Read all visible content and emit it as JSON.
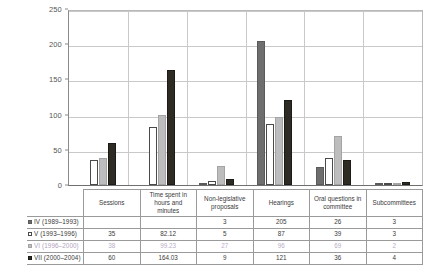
{
  "chart_data": {
    "type": "bar",
    "title": "",
    "xlabel": "",
    "ylabel": "",
    "ylim": [
      0,
      250
    ],
    "yticks": [
      0,
      50,
      100,
      150,
      200,
      250
    ],
    "grid": true,
    "legend_position": "table-left",
    "categories": [
      "Sessions",
      "Time spent in hours and minutes",
      "Non-legislative proposals",
      "Hearings",
      "Oral questions in committee",
      "Subcommittees"
    ],
    "series": [
      {
        "name": "IV (1989–1993)",
        "key": "s0",
        "color": "#6e6e6e",
        "values": [
          null,
          null,
          3,
          205,
          26,
          3
        ],
        "display": [
          "",
          "",
          "3",
          "205",
          "26",
          "3"
        ]
      },
      {
        "name": "V (1993–1996)",
        "key": "s1",
        "color": "#ffffff",
        "values": [
          35,
          82.12,
          5,
          87,
          39,
          3
        ],
        "display": [
          "35",
          "82.12",
          "5",
          "87",
          "39",
          "3"
        ]
      },
      {
        "name": "VI (1996–2000)",
        "key": "s2",
        "color": "#bdbdbd",
        "values": [
          38,
          99.23,
          27,
          96,
          69,
          2
        ],
        "display": [
          "38",
          "99.23",
          "27",
          "96",
          "69",
          "2"
        ],
        "faded": true
      },
      {
        "name": "VII (2000–2004)",
        "key": "s3",
        "color": "#2e2b24",
        "values": [
          60,
          164.03,
          9,
          121,
          36,
          4
        ],
        "display": [
          "60",
          "164.03",
          "9",
          "121",
          "36",
          "4"
        ]
      }
    ]
  },
  "table": {
    "corner_label": "",
    "headers": [
      "Sessions",
      "Time spent in hours and minutes",
      "Non-legislative proposals",
      "Hearings",
      "Oral questions in committee",
      "Subcommittees"
    ],
    "rows": [
      {
        "label": "IV  (1989–1993)",
        "key": "s0",
        "cells": [
          "",
          "",
          "3",
          "205",
          "26",
          "3"
        ]
      },
      {
        "label": "V  (1993–1996)",
        "key": "s1",
        "cells": [
          "35",
          "82.12",
          "5",
          "87",
          "39",
          "3"
        ]
      },
      {
        "label": "VI  (1996–2000)",
        "key": "s2",
        "cells": [
          "38",
          "99.23",
          "27",
          "96",
          "69",
          "2"
        ]
      },
      {
        "label": "VII (2000–2004)",
        "key": "s3",
        "cells": [
          "60",
          "164.03",
          "9",
          "121",
          "36",
          "4"
        ]
      }
    ]
  },
  "axis": {
    "ticks": [
      "250",
      "200",
      "150",
      "100",
      "50",
      "0"
    ]
  }
}
